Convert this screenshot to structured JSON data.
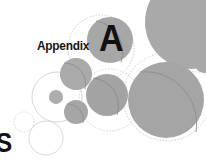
{
  "page": {
    "width": 206,
    "height": 161,
    "background_color": "#ffffff",
    "kind": "book-appendix-divider"
  },
  "labels": {
    "appendix_text": "Appendix",
    "letter_text": "A",
    "edge_glyph_text": "S"
  },
  "colors": {
    "background": "#ffffff",
    "circle_fill_gray": "#a8a8a8",
    "circle_fill_gray_dark": "#9a9a9a",
    "circle_fill_gray_light": "#b5b5b5",
    "outline_dotted": "#c9c9c9",
    "outline_solid": "#d5d5d5",
    "arc_line": "#8e8e8e",
    "text_dark": "#111111"
  },
  "graphic": {
    "type": "overlapping-circles-decoration",
    "filled_circles": [
      {
        "name": "circle-top-right-large",
        "cx": 192,
        "cy": 22,
        "r": 47
      },
      {
        "name": "circle-letter-a",
        "cx": 110,
        "cy": 40,
        "r": 23,
        "arc": true
      },
      {
        "name": "circle-right-mid",
        "cx": 166,
        "cy": 100,
        "r": 38,
        "arc": true
      },
      {
        "name": "circle-center",
        "cx": 107,
        "cy": 95,
        "r": 21,
        "arc": true
      },
      {
        "name": "circle-left-mid",
        "cx": 76,
        "cy": 74,
        "r": 16,
        "arc": true
      },
      {
        "name": "circle-left-lower",
        "cx": 76,
        "cy": 112,
        "r": 12,
        "arc": true
      },
      {
        "name": "circle-small-inner",
        "cx": 56,
        "cy": 97,
        "r": 7
      },
      {
        "name": "circle-right-edge-sliver",
        "cx": 204,
        "cy": 62,
        "r": 11
      }
    ],
    "dotted_circles": [
      {
        "name": "dotted-circle-upper",
        "cx": 101,
        "cy": 48,
        "r": 33
      },
      {
        "name": "dotted-circle-right",
        "cx": 167,
        "cy": 97,
        "r": 44
      },
      {
        "name": "dotted-circle-center",
        "cx": 110,
        "cy": 100,
        "r": 31
      },
      {
        "name": "dotted-circle-small-left",
        "cx": 24,
        "cy": 122,
        "r": 10
      },
      {
        "name": "dotted-circle-far-right",
        "cx": 198,
        "cy": 46,
        "r": 26
      }
    ],
    "outline_circles": [
      {
        "name": "outline-circle-left",
        "cx": 57,
        "cy": 97,
        "r": 25
      },
      {
        "name": "outline-circle-bottom",
        "cx": 46,
        "cy": 138,
        "r": 17
      }
    ],
    "arcs": [
      {
        "name": "arc-letter-a-circle"
      },
      {
        "name": "arc-right-mid-circle"
      },
      {
        "name": "arc-center-circle"
      },
      {
        "name": "arc-left-mid-circle"
      },
      {
        "name": "arc-left-lower-circle"
      }
    ]
  }
}
